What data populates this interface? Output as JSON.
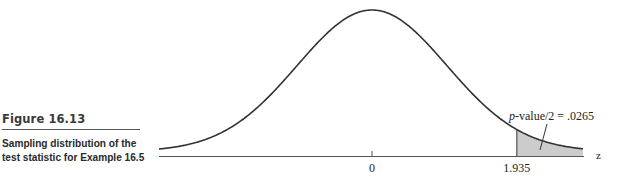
{
  "figure": {
    "label": "Figure 16.13",
    "description_line1": "Sampling distribution of the",
    "description_line2": "test statistic for Example 16.5"
  },
  "chart_data": {
    "type": "area",
    "title": "Sampling distribution of the test statistic for Example 16.5",
    "distribution": "standard normal",
    "xlabel": "z",
    "ylabel": "",
    "x_ticks": [
      {
        "value": 0,
        "label": "0"
      },
      {
        "value": 1.935,
        "label": "1.935"
      }
    ],
    "shaded_region": {
      "from": 1.935,
      "to": "infinity",
      "color": "#cccccc"
    },
    "annotation": {
      "text_italic": "p",
      "text": "-value/2 = .0265",
      "full": "p-value/2 = .0265",
      "p_value_half": 0.0265
    },
    "grid": false,
    "legend": null
  }
}
